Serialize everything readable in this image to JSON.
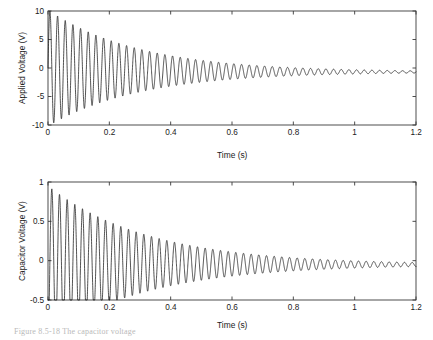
{
  "figure": {
    "caption": "Figure 8.5-18 The capacitor voltage"
  },
  "chart_data": [
    {
      "id": "applied-voltage",
      "type": "line",
      "title": "",
      "xlabel": "Time (s)",
      "ylabel": "Applied Voltage (V)",
      "xlim": [
        0,
        1.2
      ],
      "ylim": [
        -10,
        10
      ],
      "xticks": [
        0,
        0.2,
        0.4,
        0.6,
        0.8,
        1,
        1.2
      ],
      "xticklabels": [
        "0",
        "0.2",
        "0.4",
        "0.6",
        "0.8",
        "1",
        "1.2"
      ],
      "yticks": [
        -10,
        -5,
        0,
        5,
        10
      ],
      "yticklabels": [
        "-10",
        "-5",
        "0",
        "5",
        "10"
      ],
      "grid": false,
      "legend": null,
      "line_color": "#1a1a1a",
      "series": [
        {
          "name": "Applied Voltage",
          "model": "damped-sinusoid-with-offset",
          "amplitude": 10.2,
          "decay_tau": 0.3,
          "frequency_hz": 40.0,
          "phase_rad": 0.0,
          "offset_initial": 0.0,
          "offset_final": -0.7,
          "offset_tau": 0.3,
          "first_peak": 9.7,
          "first_trough": -8.8,
          "steady_state": -0.7,
          "samples_per_second": 4000
        }
      ]
    },
    {
      "id": "capacitor-voltage",
      "type": "line",
      "title": "",
      "xlabel": "Time (s)",
      "ylabel": "Capacitor Voltage (V)",
      "xlim": [
        0,
        1.2
      ],
      "ylim": [
        -0.5,
        1
      ],
      "xticks": [
        0,
        0.2,
        0.4,
        0.6,
        0.8,
        1,
        1.2
      ],
      "xticklabels": [
        "0",
        "0.2",
        "0.4",
        "0.6",
        "0.8",
        "1",
        "1.2"
      ],
      "yticks": [
        -0.5,
        0,
        0.5,
        1
      ],
      "yticklabels": [
        "-0.5",
        "0",
        "0.5",
        "1"
      ],
      "grid": false,
      "legend": null,
      "line_color": "#1a1a1a",
      "series": [
        {
          "name": "Capacitor Voltage",
          "model": "damped-sinusoid-with-offset",
          "amplitude": 0.95,
          "decay_tau": 0.33,
          "frequency_hz": 40.0,
          "phase_rad": -1.5708,
          "offset_initial": 0.0,
          "offset_final": -0.05,
          "offset_tau": 0.3,
          "first_peak": 0.87,
          "first_trough": -0.19,
          "steady_state": -0.05,
          "samples_per_second": 4000
        }
      ]
    }
  ]
}
